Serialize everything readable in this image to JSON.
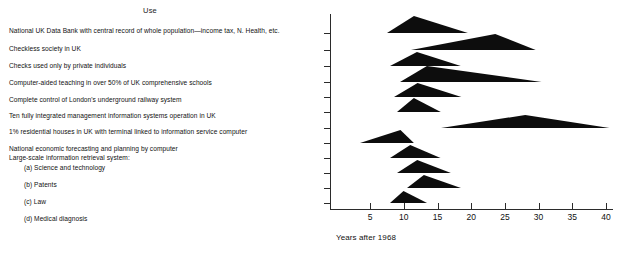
{
  "header": {
    "column_title": "Use"
  },
  "uses": [
    {
      "label": "National UK Data Bank with central record of whole population—income tax, N. Health, etc.",
      "top": 27,
      "indent": false
    },
    {
      "label": "Checkless society in UK",
      "top": 45,
      "indent": false
    },
    {
      "label": "Checks used only by private individuals",
      "top": 62,
      "indent": false
    },
    {
      "label": "Computer-aided teaching in over 50% of UK comprehensive schools",
      "top": 79,
      "indent": false
    },
    {
      "label": "Complete control of London's underground railway system",
      "top": 96,
      "indent": false
    },
    {
      "label": "Ten fully integrated management information systems operation in UK",
      "top": 112,
      "indent": false
    },
    {
      "label": "1% residential houses in UK with terminal linked to information service computer",
      "top": 128,
      "indent": false
    },
    {
      "label": "National economic forecasting and planning by computer",
      "top": 145,
      "indent": false
    },
    {
      "label": "Large-scale information retrieval system:",
      "top": 154,
      "indent": false
    },
    {
      "label": "(a) Science and technology",
      "top": 164,
      "indent": true
    },
    {
      "label": "(b) Patents",
      "top": 181,
      "indent": true
    },
    {
      "label": "(c) Law",
      "top": 198,
      "indent": true
    },
    {
      "label": "(d) Medical diagnosis",
      "top": 215,
      "indent": true
    }
  ],
  "chart_data": {
    "type": "area",
    "title": "",
    "xlabel": "Years after 1968",
    "ylabel": "",
    "xlim": [
      0,
      41
    ],
    "grid": false,
    "legend": "none",
    "x_ticks": [
      5,
      10,
      15,
      20,
      25,
      30,
      35,
      40
    ],
    "x_tick_labels": [
      "5",
      "10",
      "15",
      "20",
      "25",
      "30",
      "35",
      "40"
    ],
    "note": "Each row is a Delphi-style forecast distribution drawn as a filled triangle: earliest, most-likely (mode/peak) and latest year after 1968.",
    "series": [
      {
        "name": "National UK Data Bank with central record of whole population—income tax, N. Health, etc.",
        "start": 7.5,
        "peak": 11.5,
        "end": 19.5,
        "height": 17
      },
      {
        "name": "Checkless society in UK",
        "start": 11.0,
        "peak": 23.5,
        "end": 29.5,
        "height": 16
      },
      {
        "name": "Checks used only by private individuals",
        "start": 8.0,
        "peak": 12.0,
        "end": 18.5,
        "height": 14
      },
      {
        "name": "Computer-aided teaching in over 50% of UK comprehensive schools",
        "start": 9.5,
        "peak": 13.5,
        "end": 30.5,
        "height": 16
      },
      {
        "name": "Complete control of London's underground railway system",
        "start": 8.5,
        "peak": 12.0,
        "end": 18.5,
        "height": 14
      },
      {
        "name": "Ten fully integrated management information systems operation in UK",
        "start": 9.0,
        "peak": 11.5,
        "end": 15.5,
        "height": 14
      },
      {
        "name": "1% residential houses in UK with terminal linked to information service computer",
        "start": 15.5,
        "peak": 28.0,
        "end": 40.5,
        "height": 13
      },
      {
        "name": "National economic forecasting and planning by computer",
        "start": 3.5,
        "peak": 9.5,
        "end": 11.5,
        "height": 13
      },
      {
        "name": "Large-scale information retrieval system: (a) Science and technology",
        "start": 8.0,
        "peak": 11.0,
        "end": 15.5,
        "height": 13
      },
      {
        "name": "(b) Patents",
        "start": 9.0,
        "peak": 12.0,
        "end": 17.0,
        "height": 13
      },
      {
        "name": "(c) Law",
        "start": 10.5,
        "peak": 13.0,
        "end": 18.5,
        "height": 13
      },
      {
        "name": "(d) Medical diagnosis",
        "start": 8.0,
        "peak": 10.0,
        "end": 13.5,
        "height": 12
      }
    ],
    "rows_baseline_px": [
      33,
      50,
      66,
      82,
      97,
      112,
      128,
      143,
      158,
      173,
      188,
      203
    ]
  }
}
